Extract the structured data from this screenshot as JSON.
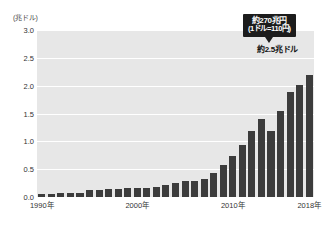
{
  "chart_data": {
    "type": "bar",
    "title": "",
    "subtitle": "",
    "xlabel": "",
    "ylabel": "(兆ドル)",
    "ylim": [
      0.0,
      3.0
    ],
    "grid": true,
    "legend_position": "none",
    "y_ticks": [
      "3.0",
      "2.5",
      "2.0",
      "1.5",
      "1.0",
      "0.5",
      "0.0"
    ],
    "y_tick_values": [
      3.0,
      2.5,
      2.0,
      1.5,
      1.0,
      0.5,
      0.0
    ],
    "x_tick_labels": [
      "1990年",
      "2000年",
      "2010年",
      "2018年"
    ],
    "x_tick_categories": [
      "1990",
      "2000",
      "2010",
      "2018"
    ],
    "categories": [
      "1990",
      "1991",
      "1992",
      "1993",
      "1994",
      "1995",
      "1996",
      "1997",
      "1998",
      "1999",
      "2000",
      "2001",
      "2002",
      "2003",
      "2004",
      "2005",
      "2006",
      "2007",
      "2008",
      "2009",
      "2010",
      "2011",
      "2012",
      "2013",
      "2014",
      "2015",
      "2016",
      "2017",
      "2018"
    ],
    "values": [
      0.06,
      0.06,
      0.07,
      0.08,
      0.08,
      0.12,
      0.13,
      0.14,
      0.14,
      0.16,
      0.17,
      0.17,
      0.18,
      0.21,
      0.26,
      0.28,
      0.29,
      0.33,
      0.43,
      0.57,
      0.73,
      0.94,
      1.19,
      1.41,
      1.18,
      1.55,
      1.88,
      2.02,
      2.19
    ],
    "bar_color": "#3c3c3c",
    "panel_color": "#e7e7e7",
    "gridline_color": "#ffffff",
    "background_color": "#ffffff",
    "annotations": [
      {
        "id": "callout",
        "line1": "約270兆円",
        "line2": "(1ドル=110円)",
        "style": "black-box-with-arrow",
        "points_to_category": "2018"
      },
      {
        "id": "value-label",
        "text": "約2.5兆ドル",
        "style": "bold-text",
        "points_to_category": "2018"
      }
    ]
  },
  "axis": {
    "y_unit_caption": "(兆ドル)"
  }
}
